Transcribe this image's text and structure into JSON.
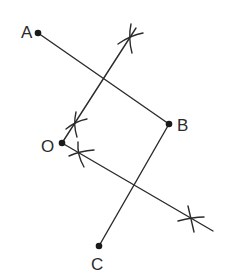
{
  "diagram": {
    "type": "geometric-construction",
    "points": [
      {
        "id": "A",
        "label": "A",
        "x": 38,
        "y": 33,
        "label_x": 21,
        "label_y": 38
      },
      {
        "id": "B",
        "label": "B",
        "x": 169,
        "y": 124,
        "label_x": 177,
        "label_y": 131
      },
      {
        "id": "O",
        "label": "O",
        "x": 62,
        "y": 143,
        "label_x": 41,
        "label_y": 152
      },
      {
        "id": "C",
        "label": "C",
        "x": 99,
        "y": 246,
        "label_x": 91,
        "label_y": 270
      }
    ],
    "segments": [
      {
        "name": "segment-AB",
        "from": [
          38,
          33
        ],
        "to": [
          169,
          124
        ]
      },
      {
        "name": "segment-BC",
        "from": [
          169,
          124
        ],
        "to": [
          99,
          246
        ]
      },
      {
        "name": "bisector-line-1",
        "from": [
          62,
          143
        ],
        "to": [
          136,
          28
        ]
      },
      {
        "name": "bisector-line-2",
        "from": [
          62,
          143
        ],
        "to": [
          213,
          231
        ]
      }
    ],
    "arc_marks": [
      {
        "name": "arc-mark-1",
        "x": 131,
        "y": 37
      },
      {
        "name": "arc-mark-2",
        "x": 76,
        "y": 124
      },
      {
        "name": "arc-mark-3",
        "x": 80,
        "y": 153
      },
      {
        "name": "arc-mark-4",
        "x": 193,
        "y": 219
      }
    ],
    "colors": {
      "stroke": "#2b2b2b",
      "background": "#ffffff"
    }
  }
}
